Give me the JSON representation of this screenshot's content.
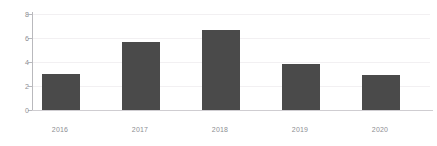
{
  "chart_data": {
    "type": "bar",
    "title": "",
    "subtitle": "",
    "xlabel": "",
    "ylabel": "",
    "categories": [
      "2016",
      "2017",
      "2018",
      "2019",
      "2020"
    ],
    "values": [
      3.0,
      5.7,
      6.7,
      3.8,
      2.9
    ],
    "series": [
      {
        "name": "",
        "values": [
          3.0,
          5.7,
          6.7,
          3.8,
          2.9
        ]
      }
    ],
    "ylim": [
      0,
      8
    ],
    "xlim": null,
    "y_ticks": [
      0,
      2,
      4,
      6,
      8
    ],
    "y_tick_labels": [
      "0",
      "2",
      "4",
      "6",
      "8"
    ],
    "x_tick_labels": [
      "2016",
      "2017",
      "2018",
      "2019",
      "2020"
    ],
    "grid": true,
    "grid_axis": "y",
    "legend": false,
    "legend_position": "none",
    "annotations": [],
    "data_labels": false,
    "colors": {
      "bar": "#4a4a4a",
      "background": "#ffffff",
      "gridline": "#f2f0f2",
      "axis_line": "#b9b9bd",
      "baseline": "#cfcdd1",
      "tick_label": "#8e8e93"
    }
  }
}
